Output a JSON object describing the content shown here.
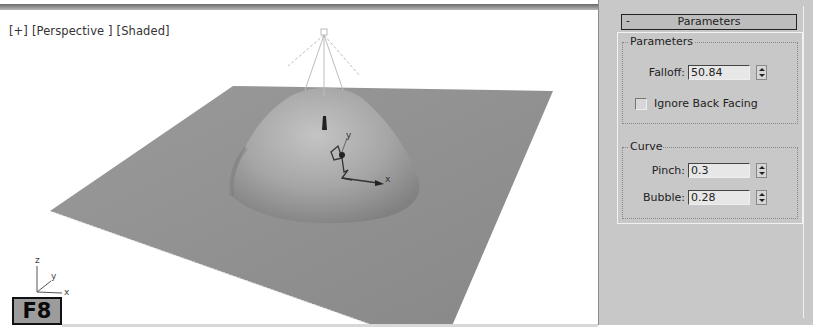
{
  "viewport": {
    "label": {
      "menu": "[+]",
      "view": "[Perspective ]",
      "shading": "[Shaded]"
    },
    "axis_tripod": {
      "x": "x",
      "y": "y",
      "z": "z"
    },
    "gizmo_axes": {
      "x": "x",
      "y": "y"
    },
    "badge": "F8"
  },
  "command_panel": {
    "rollout": {
      "collapse_glyph": "-",
      "title": "Parameters"
    },
    "parameters_group": {
      "title": "Parameters",
      "falloff": {
        "label": "Falloff:",
        "value": "50.84"
      },
      "ignore_back_facing": {
        "label": "Ignore Back Facing",
        "checked": false
      }
    },
    "curve_group": {
      "title": "Curve",
      "pinch": {
        "label": "Pinch:",
        "value": "0.3"
      },
      "bubble": {
        "label": "Bubble:",
        "value": "0.28"
      }
    }
  },
  "colors": {
    "plane": "#8e8e8e",
    "panel_bg": "#c8c8c8",
    "viewport_bg": "#ffffff"
  }
}
